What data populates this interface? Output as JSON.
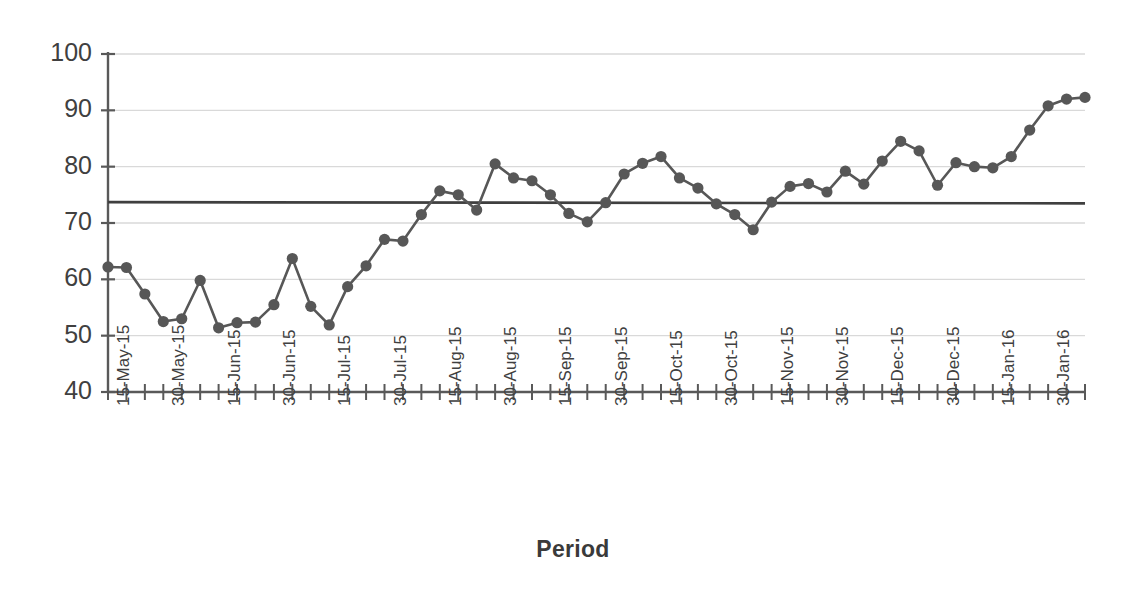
{
  "chart_data": {
    "type": "line",
    "title": "",
    "subtitle": "",
    "xlabel": "Period",
    "ylabel": "",
    "ylim": [
      40,
      100
    ],
    "ytick_values": [
      40,
      50,
      60,
      70,
      80,
      90,
      100
    ],
    "ytick_labels": [
      "40",
      "50",
      "60",
      "70",
      "80",
      "90",
      "100"
    ],
    "grid": "horizontal",
    "legend": "none",
    "marker": "filled-circle",
    "series_color": "#575757",
    "grid_color": "#d9d9d9",
    "axis_color": "#595959",
    "reference_line": {
      "label": "",
      "value": 73.7,
      "color": "#3f3f3f"
    },
    "x": [
      "15-May-15",
      "16-May-15",
      "17-May-15",
      "18-May-15",
      "19-May-15",
      "20-May-15",
      "30-May-15",
      "31-May-15",
      "01-Jun-15",
      "02-Jun-15",
      "03-Jun-15",
      "15-Jun-15",
      "16-Jun-15",
      "17-Jun-15",
      "18-Jun-15",
      "19-Jun-15",
      "30-Jun-15",
      "01-Jul-15",
      "02-Jul-15",
      "03-Jul-15",
      "04-Jul-15",
      "15-Jul-15",
      "16-Jul-15",
      "17-Jul-15",
      "18-Jul-15",
      "19-Jul-15",
      "30-Jul-15",
      "31-Jul-15",
      "01-Aug-15",
      "02-Aug-15",
      "03-Aug-15",
      "15-Aug-15",
      "16-Aug-15",
      "17-Aug-15",
      "18-Aug-15",
      "19-Aug-15",
      "30-Aug-15",
      "31-Aug-15",
      "01-Sep-15",
      "02-Sep-15",
      "03-Sep-15",
      "15-Sep-15",
      "16-Sep-15",
      "17-Sep-15",
      "18-Sep-15",
      "19-Sep-15"
    ],
    "xtick_labels": [
      "15-May-15",
      "30-May-15",
      "15-Jun-15",
      "30-Jun-15",
      "15-Jul-15",
      "30-Jul-15",
      "15-Aug-15",
      "30-Aug-15",
      "15-Sep-15",
      "30-Sep-15",
      "15-Oct-15",
      "30-Oct-15",
      "15-Nov-15",
      "30-Nov-15",
      "15-Dec-15",
      "30-Dec-15",
      "15-Jan-16",
      "30-Jan-16"
    ],
    "xtick_label_interval": 3,
    "n_points": 46,
    "values": [
      62.2,
      62.1,
      57.4,
      52.5,
      53.0,
      59.8,
      51.4,
      52.3,
      52.4,
      55.5,
      63.7,
      55.2,
      51.9,
      58.7,
      62.4,
      67.1,
      66.8,
      71.5,
      75.7,
      75.0,
      72.3,
      80.5,
      78.0,
      77.5,
      75.0,
      71.7,
      70.2,
      73.6,
      78.7,
      80.6,
      81.8,
      78.0,
      76.2,
      73.4,
      71.5,
      68.8,
      73.7,
      76.5,
      77.0,
      75.5,
      79.2,
      76.9,
      81.0,
      84.5,
      82.8,
      76.7
    ],
    "values_tail": [
      80.7,
      80.0,
      79.8,
      81.8,
      86.5,
      90.8,
      92.0,
      92.3
    ]
  }
}
